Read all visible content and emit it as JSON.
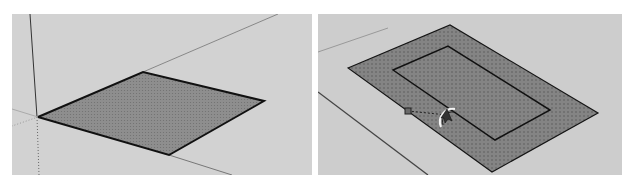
{
  "panels": [
    {
      "id": "left",
      "description": "Rectangle face drawn on ground plane at origin",
      "background": "#d2d2d2",
      "face": {
        "points": [
          [
            26,
            103
          ],
          [
            131,
            58
          ],
          [
            252,
            87
          ],
          [
            157,
            141
          ]
        ],
        "fill": "#8e8e8e",
        "edge_color": "#111111"
      },
      "axes": {
        "vertical": [
          [
            18,
            0
          ],
          [
            25,
            103
          ]
        ],
        "vertical_dotted": [
          [
            25,
            103
          ],
          [
            27,
            161
          ]
        ],
        "red_axis": [
          [
            131,
            58
          ],
          [
            266,
            0
          ]
        ],
        "green_axis_dotted": [
          [
            26,
            103
          ],
          [
            0,
            112
          ]
        ],
        "green_axis_ext": [
          [
            157,
            141
          ],
          [
            220,
            161
          ]
        ],
        "lower_left": [
          [
            26,
            103
          ],
          [
            0,
            95
          ]
        ]
      }
    },
    {
      "id": "right",
      "description": "Offset tool creating inner rectangle inside face",
      "background": "#cdcdcd",
      "outer_face": {
        "points": [
          [
            30,
            54
          ],
          [
            132,
            11
          ],
          [
            280,
            99
          ],
          [
            174,
            158
          ]
        ],
        "fill": "#838383",
        "edge_color": "#151515"
      },
      "inner_rect": {
        "points": [
          [
            75,
            56
          ],
          [
            130,
            32
          ],
          [
            232,
            96
          ],
          [
            177,
            126
          ]
        ],
        "edge_color": "#111111"
      },
      "guide_lines": [
        [
          [
            0,
            38
          ],
          [
            70,
            0
          ]
        ],
        [
          [
            0,
            78
          ],
          [
            110,
            161
          ]
        ]
      ],
      "inference_point": [
        90,
        97
      ],
      "cursor": {
        "icon": "offset-tool-cursor",
        "position": [
          129,
          101
        ]
      },
      "dotted_guide": [
        [
          90,
          97
        ],
        [
          129,
          101
        ]
      ]
    }
  ]
}
